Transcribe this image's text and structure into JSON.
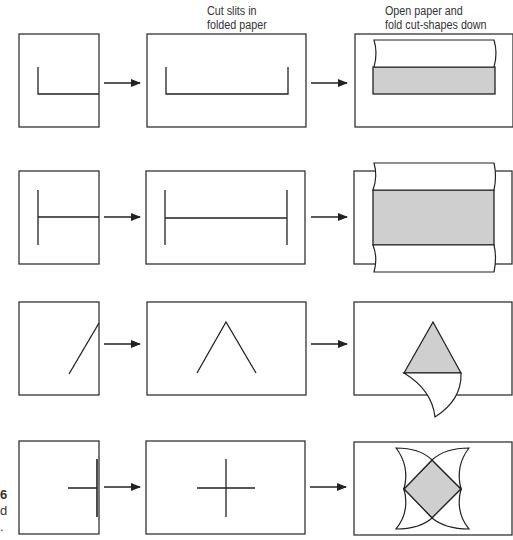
{
  "headers": {
    "cut": "Cut slits in\nfolded paper",
    "open": "Open paper and\nfold cut-shapes down"
  },
  "side_fragments": [
    "6",
    "d",
    "."
  ],
  "rows": [
    {
      "name": "row-1",
      "folded_slit": "L-shape",
      "cut_slit": "U-shape",
      "result": "rectangular flap folded down"
    },
    {
      "name": "row-2",
      "folded_slit": "T-shape",
      "cut_slit": "H-shape",
      "result": "two flaps folded outward"
    },
    {
      "name": "row-3",
      "folded_slit": "diagonal",
      "cut_slit": "inverted V",
      "result": "triangular flap folded down"
    },
    {
      "name": "row-4",
      "folded_slit": "T-cross on fold",
      "cut_slit": "plus sign",
      "result": "four petal flaps folded out"
    }
  ],
  "colors": {
    "stroke": "#222222",
    "shade": "#cfcfcf",
    "background": "#ffffff"
  }
}
